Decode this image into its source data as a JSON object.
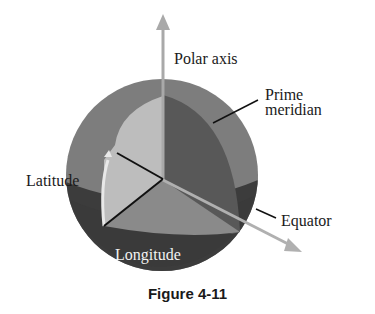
{
  "figure": {
    "caption": "Figure 4-11",
    "labels": {
      "polar_axis": "Polar axis",
      "prime_meridian_line1": "Prime",
      "prime_meridian_line2": "meridian",
      "latitude": "Latitude",
      "equator": "Equator",
      "longitude": "Longitude"
    },
    "colors": {
      "outer_sphere": "#7d7d7d",
      "lower_hemisphere": "#3c3c3c",
      "meridian_wedge": "#595959",
      "latitude_wedge": "#bdbdbd",
      "equatorial_plane": "#8a8a8a",
      "axis_arrow": "#aaaaaa",
      "radius_lines": "#111111"
    }
  }
}
